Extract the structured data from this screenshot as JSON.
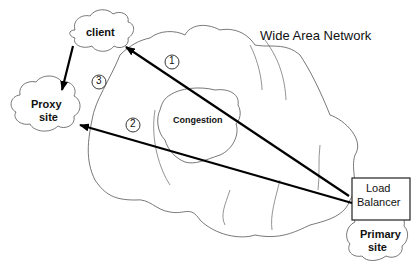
{
  "diagram": {
    "network_label": "Wide Area Network",
    "nodes": {
      "client": "client",
      "proxy": [
        "Proxy",
        "site"
      ],
      "congestion": "Congestion",
      "load_balancer": [
        "Load",
        "Balancer"
      ],
      "primary": [
        "Primary",
        "site"
      ]
    },
    "steps": [
      {
        "number": "1",
        "from": "Load Balancer",
        "to": "client"
      },
      {
        "number": "2",
        "from": "Load Balancer",
        "to": "Proxy site"
      },
      {
        "number": "3",
        "from": "client",
        "to": "Proxy site"
      }
    ],
    "colors": {
      "line": "#000000",
      "cloud_stroke": "#555555",
      "background": "#ffffff"
    }
  }
}
